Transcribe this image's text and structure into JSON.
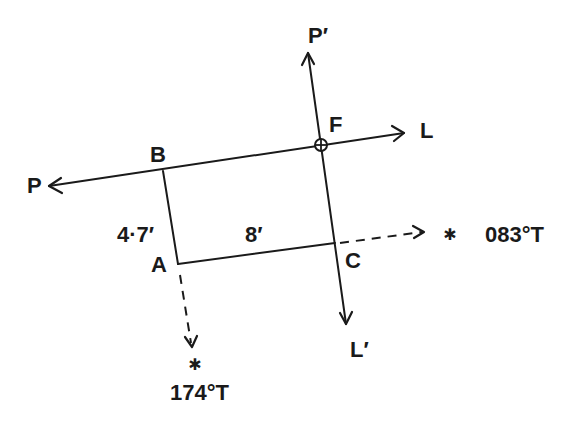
{
  "diagram": {
    "type": "running-fix-bearing-plot",
    "colors": {
      "ink": "#1a1a1a",
      "background": "#ffffff"
    },
    "points": {
      "P": {
        "label": "P"
      },
      "P_prime": {
        "label": "P′"
      },
      "L": {
        "label": "L"
      },
      "L_prime": {
        "label": "L′"
      },
      "F": {
        "label": "F"
      },
      "B": {
        "label": "B"
      },
      "A": {
        "label": "A"
      },
      "C": {
        "label": "C"
      }
    },
    "measurements": {
      "AB": "4·7′",
      "AC": "8′"
    },
    "bearings": {
      "east_star": {
        "label": "083°T",
        "symbol": "✱"
      },
      "south_star": {
        "label": "174°T",
        "symbol": "✱"
      }
    }
  }
}
